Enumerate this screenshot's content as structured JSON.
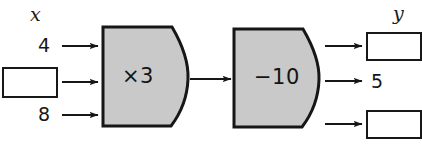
{
  "figure": {
    "type": "function-machine-diagram",
    "title": "",
    "background_color": "#ffffff",
    "machine_fill_color": "#c9c9c9",
    "stroke_color": "#161616"
  },
  "input": {
    "variable_label": "x",
    "entries": [
      {
        "id": "input-top",
        "kind": "number",
        "value": "4"
      },
      {
        "id": "input-middle",
        "kind": "box",
        "value": ""
      },
      {
        "id": "input-bottom",
        "kind": "number",
        "value": "8"
      }
    ]
  },
  "machines": [
    {
      "id": "machine-multiply",
      "label": "×3",
      "operation": "multiply",
      "operand": "3"
    },
    {
      "id": "machine-subtract",
      "label": "−10",
      "operation": "subtract",
      "operand": "10"
    }
  ],
  "output": {
    "variable_label": "y",
    "entries": [
      {
        "id": "output-top",
        "kind": "box",
        "value": ""
      },
      {
        "id": "output-middle",
        "kind": "number",
        "value": "5"
      },
      {
        "id": "output-bottom",
        "kind": "box",
        "value": ""
      }
    ]
  },
  "arrows": {
    "count": 9,
    "color": "#161616"
  }
}
